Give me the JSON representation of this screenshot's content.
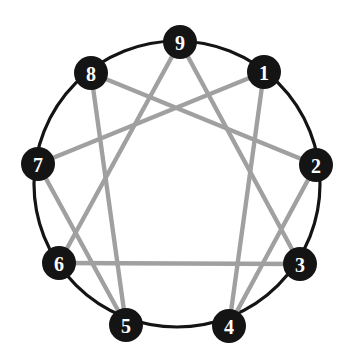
{
  "figure": {
    "name": "Enneagram symbol",
    "background_color": "#ffffff",
    "ring_color": "#141414",
    "node_fill_color": "#141414",
    "node_label_color": "#ffffff",
    "inner_line_color": "#a0a0a0",
    "ring_stroke_width": 3.2,
    "inner_stroke_width": 4.4,
    "center": {
      "x": 177,
      "y": 184
    },
    "radius": 143,
    "node_radius": 17
  },
  "nodes": [
    {
      "id": "1",
      "label": "1",
      "x": 264,
      "y": 72,
      "angle_deg": -50
    },
    {
      "id": "2",
      "label": "2",
      "x": 316,
      "y": 165,
      "angle_deg": -10
    },
    {
      "id": "3",
      "label": "3",
      "x": 300,
      "y": 264,
      "angle_deg": 30
    },
    {
      "id": "4",
      "label": "4",
      "x": 229,
      "y": 326,
      "angle_deg": 70
    },
    {
      "id": "5",
      "label": "5",
      "x": 126,
      "y": 325,
      "angle_deg": 110
    },
    {
      "id": "6",
      "label": "6",
      "x": 59,
      "y": 263,
      "angle_deg": 150
    },
    {
      "id": "7",
      "label": "7",
      "x": 38,
      "y": 164,
      "angle_deg": 190
    },
    {
      "id": "8",
      "label": "8",
      "x": 91,
      "y": 73,
      "angle_deg": 230
    },
    {
      "id": "9",
      "label": "9",
      "x": 180,
      "y": 42,
      "angle_deg": 270
    }
  ],
  "inner_lines": {
    "triangle": {
      "name": "triangle-3-6-9",
      "sequence": [
        "9",
        "3",
        "6"
      ],
      "closed": true,
      "segments": [
        {
          "from": "9",
          "to": "3"
        },
        {
          "from": "3",
          "to": "6"
        },
        {
          "from": "6",
          "to": "9"
        }
      ]
    },
    "hexad": {
      "name": "hexad-1-4-2-8-5-7",
      "sequence": [
        "1",
        "4",
        "2",
        "8",
        "5",
        "7"
      ],
      "closed": true,
      "segments": [
        {
          "from": "1",
          "to": "4"
        },
        {
          "from": "4",
          "to": "2"
        },
        {
          "from": "2",
          "to": "8"
        },
        {
          "from": "8",
          "to": "5"
        },
        {
          "from": "5",
          "to": "7"
        },
        {
          "from": "7",
          "to": "1"
        }
      ]
    }
  }
}
